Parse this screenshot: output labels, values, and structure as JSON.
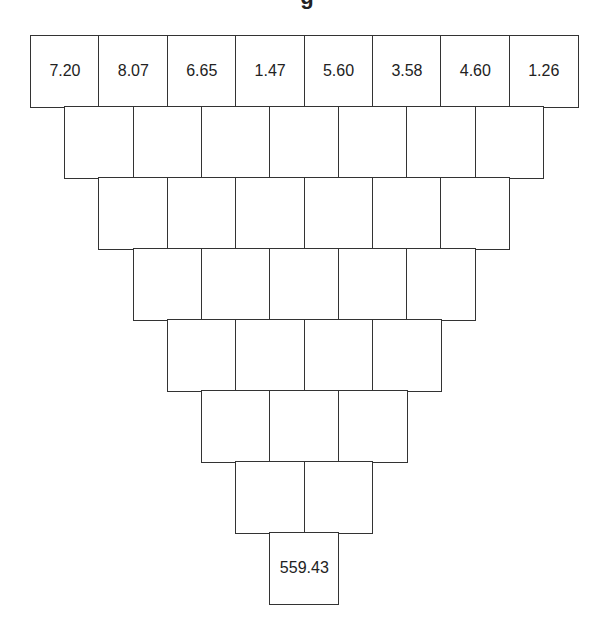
{
  "title": "g",
  "pyramid": {
    "rows": [
      [
        "7.20",
        "8.07",
        "6.65",
        "1.47",
        "5.60",
        "3.58",
        "4.60",
        "1.26"
      ],
      [
        "",
        "",
        "",
        "",
        "",
        "",
        ""
      ],
      [
        "",
        "",
        "",
        "",
        "",
        ""
      ],
      [
        "",
        "",
        "",
        "",
        ""
      ],
      [
        "",
        "",
        "",
        ""
      ],
      [
        "",
        "",
        ""
      ],
      [
        "",
        ""
      ],
      [
        "559.43"
      ]
    ]
  }
}
